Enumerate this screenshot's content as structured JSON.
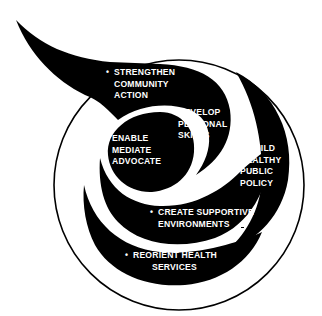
{
  "diagram": {
    "colors": {
      "background": "#ffffff",
      "shape_fill": "#000000",
      "outline": "#000000",
      "text": "#ffffff"
    },
    "bullet": "•",
    "items": [
      {
        "id": "strengthen-community-action",
        "lines": [
          "STRENGTHEN",
          "COMMUNITY",
          "ACTION"
        ]
      },
      {
        "id": "develop-personal-skills",
        "lines": [
          "DEVELOP",
          "PERSONAL",
          "SKILLS"
        ]
      },
      {
        "id": "build-healthy-public-policy",
        "lines": [
          "BUILD",
          "HEALTHY",
          "PUBLIC",
          "POLICY"
        ]
      },
      {
        "id": "create-supportive-environments",
        "lines": [
          "CREATE SUPPORTIVE",
          "ENVIRONMENTS"
        ]
      },
      {
        "id": "reorient-health-services",
        "lines": [
          "REORIENT HEALTH",
          "SERVICES"
        ]
      }
    ],
    "center": {
      "lines": [
        "ENABLE",
        "MEDIATE",
        "ADVOCATE"
      ]
    }
  }
}
